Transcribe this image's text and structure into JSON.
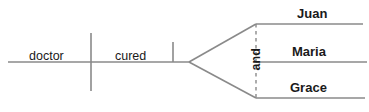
{
  "diagram": {
    "type": "sentence-diagram",
    "style": "Reed-Kellogg",
    "sentence": "The doctor cured Juan, Maria and Grace",
    "colors": {
      "line": "#8a8a8a",
      "text": "#1a1a1a",
      "background": "#ffffff"
    },
    "baseline": {
      "subject": "doctor",
      "verb": "cured"
    },
    "conjunction": "and",
    "objects": [
      {
        "label": "Juan"
      },
      {
        "label": "Maria"
      },
      {
        "label": "Grace"
      }
    ]
  }
}
